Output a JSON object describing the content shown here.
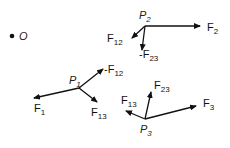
{
  "origin": {
    "label": "O"
  },
  "points": [
    {
      "id": "P1",
      "label": "P",
      "sub": "1"
    },
    {
      "id": "P2",
      "label": "P",
      "sub": "2"
    },
    {
      "id": "P3",
      "label": "P",
      "sub": "3"
    }
  ],
  "forces": {
    "p2": [
      {
        "label": "F",
        "sub": "2"
      },
      {
        "label": "F",
        "sub": "12"
      },
      {
        "label": "-F",
        "sub": "23"
      }
    ],
    "p1": [
      {
        "label": "F",
        "sub": "1"
      },
      {
        "label": "F",
        "sub": "13"
      },
      {
        "label": "-F",
        "sub": "12"
      }
    ],
    "p3": [
      {
        "label": "F",
        "sub": "3"
      },
      {
        "label": "F",
        "sub": "23"
      },
      {
        "label": "F",
        "sub": "13"
      }
    ]
  }
}
